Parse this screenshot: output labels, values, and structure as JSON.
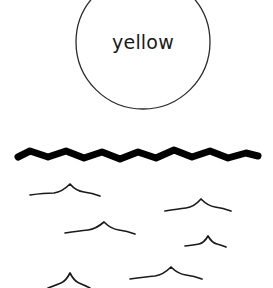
{
  "canvas": {
    "width": 273,
    "height": 288,
    "background_color": "#ffffff"
  },
  "circle_label": {
    "text": "yellow",
    "text_color": "#1a1a1a",
    "stroke_color": "#2b2b2b",
    "stroke_width": 1.3,
    "center_x": 143,
    "center_y": 42,
    "radius": 67,
    "note_clipped_top": true
  },
  "main_wave": {
    "name": "thick-wave-line",
    "stroke_color": "#000000",
    "stroke_width": 7,
    "path": "M 18 157 L 30 151 L 48 157 L 66 151 L 84 158 L 102 152 L 120 159 L 138 152 L 156 158 L 174 150 L 192 157 L 210 151 L 228 158 L 246 153 L 258 156",
    "x_start": 18,
    "x_end": 258,
    "y_center": 155,
    "peak_count": 6
  },
  "small_waves": {
    "stroke_color": "#1a1a1a",
    "stroke_width": 1.7,
    "groups": [
      {
        "name": "wave-group-1",
        "peaks": 2,
        "path": "M 30 195 Q 44 193 54 193 Q 62 192 70 184 Q 76 191 84 192 Q 92 193 100 196"
      },
      {
        "name": "wave-group-2",
        "peaks": 2,
        "path": "M 165 211 Q 178 209 186 208 Q 194 207 201 199 Q 208 206 215 207 Q 223 208 231 211"
      },
      {
        "name": "wave-group-3",
        "peaks": 2,
        "path": "M 65 233 Q 79 231 88 230 Q 96 229 104 222 Q 111 229 119 230 Q 127 231 135 234"
      },
      {
        "name": "wave-group-4",
        "peaks": 1,
        "path": "M 185 246 Q 194 245 199 244 Q 204 243 208 236 Q 212 243 217 244 Q 221 245 226 247"
      },
      {
        "name": "wave-group-5",
        "peaks": 2,
        "path": "M 130 279 Q 145 277 155 276 Q 163 275 171 267 Q 178 274 186 275 Q 194 276 202 279"
      },
      {
        "name": "wave-group-6",
        "peaks": 1,
        "path": "M 48 288 Q 56 285 61 283 Q 66 281 70 273 Q 74 281 79 283 Q 84 285 90 288"
      }
    ]
  }
}
